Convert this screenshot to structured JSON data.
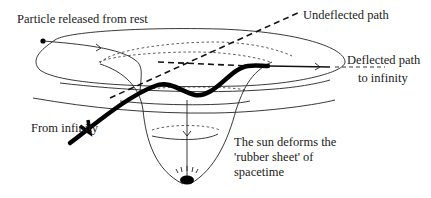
{
  "diagram": {
    "labels": {
      "particle_released": "Particle released from rest",
      "undeflected_path": "Undeflected path",
      "deflected_path_line1": "Deflected path",
      "deflected_path_line2": "to infinity",
      "from_infinity": "From infinity",
      "sun_line1": "The sun deforms the",
      "sun_line2": "'rubber sheet' of",
      "sun_line3": "spacetime"
    },
    "elements": [
      "outer-ellipse-sheet",
      "inner-dotted-rings",
      "funnel-well",
      "sun-mass",
      "particle-start-dot",
      "released-particle-path",
      "undeflected-dashed-path",
      "deflected-thick-path",
      "arrowheads"
    ],
    "colors": {
      "ink": "#111111",
      "background": "#ffffff"
    }
  }
}
